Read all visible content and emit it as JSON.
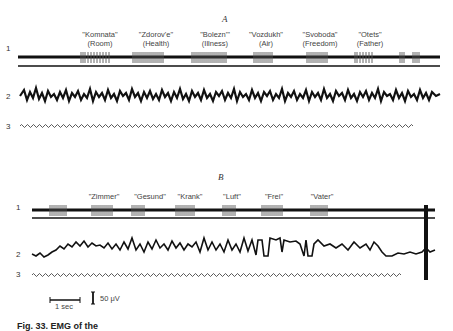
{
  "figure": {
    "panels": [
      {
        "label": "A",
        "trace_labels": [
          "1",
          "2",
          "3"
        ],
        "words": [
          {
            "word": "\"Komnata\"",
            "translation": "(Room)",
            "x": 100
          },
          {
            "word": "\"Zdorov'e\"",
            "translation": "(Health)",
            "x": 156
          },
          {
            "word": "\"Bolezn'\"",
            "translation": "(Illness)",
            "x": 215
          },
          {
            "word": "\"Vozdukh\"",
            "translation": "(Air)",
            "x": 266
          },
          {
            "word": "\"Svoboda\"",
            "translation": "(Freedom)",
            "x": 320
          },
          {
            "word": "\"Otets\"",
            "translation": "(Father)",
            "x": 370
          }
        ]
      },
      {
        "label": "B",
        "trace_labels": [
          "1",
          "2",
          "3"
        ],
        "words": [
          {
            "word": "\"Zimmer\"",
            "x": 103
          },
          {
            "word": "\"Gesund\"",
            "x": 149
          },
          {
            "word": "\"Krank\"",
            "x": 190
          },
          {
            "word": "\"Luft\"",
            "x": 232
          },
          {
            "word": "\"Frei\"",
            "x": 274
          },
          {
            "word": "\"Vater\"",
            "x": 322
          }
        ]
      }
    ],
    "scale": {
      "time_label": "1 sec",
      "amplitude_label": "50 μV"
    },
    "caption": "Fig. 33. EMG of the"
  }
}
